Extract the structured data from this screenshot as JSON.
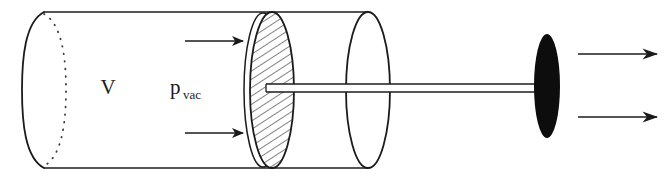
{
  "figure": {
    "kind": "technical-line-diagram",
    "width": 672,
    "height": 180,
    "background_color": "#ffffff",
    "ink_color": "#1b1b1b",
    "fill_black": "#0d0d0d"
  },
  "labels": {
    "volume": {
      "text": "V",
      "x": 108,
      "y": 94
    },
    "pressure": {
      "base": "p",
      "subscript": "vac",
      "x": 170,
      "y": 94
    }
  },
  "arrows": {
    "interior": [
      {
        "name": "interior-arrow-top",
        "x1": 185,
        "y1": 41,
        "x2": 243,
        "y2": 41
      },
      {
        "name": "interior-arrow-bottom",
        "x1": 185,
        "y1": 133,
        "x2": 243,
        "y2": 133
      }
    ],
    "exterior": [
      {
        "name": "exterior-arrow-top",
        "x1": 578,
        "y1": 54,
        "x2": 659,
        "y2": 54
      },
      {
        "name": "exterior-arrow-bottom",
        "x1": 578,
        "y1": 117,
        "x2": 659,
        "y2": 117
      }
    ]
  },
  "geometry": {
    "cylinder": {
      "top_line_y": 12,
      "bottom_line_y": 168,
      "left_x": 44,
      "right_x": 368,
      "cap_rx": 22,
      "hidden_edge_rx": 22
    },
    "mouth_ellipse": {
      "cx": 368,
      "cy": 90,
      "rx": 22,
      "ry": 78
    },
    "piston": {
      "cx": 272,
      "cy": 90,
      "rx": 22,
      "ry": 78,
      "hatch_angle_deg": 33,
      "hatch_spacing": 5
    },
    "piston_back_ellipse": {
      "cx": 263,
      "cy": 90,
      "rx": 19,
      "ry": 77
    },
    "rod": {
      "x1": 266,
      "x2": 545,
      "y_top": 84,
      "y_bottom": 92
    },
    "disk": {
      "cx": 547,
      "cy": 86,
      "rx": 13,
      "ry": 52
    }
  }
}
